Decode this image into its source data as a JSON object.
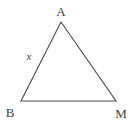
{
  "figure": {
    "type": "geometry-diagram",
    "shape": "triangle",
    "background_color": "#ffffff",
    "stroke_color": "#4a4a4a",
    "stroke_width": 1.1,
    "text_color": "#3f3f3f",
    "canvas": {
      "width": 136,
      "height": 123
    },
    "vertices": [
      {
        "name": "A",
        "label": "A",
        "x": 61,
        "y": 22,
        "label_x": 61,
        "label_y": 11
      },
      {
        "name": "B",
        "label": "B",
        "x": 21,
        "y": 101,
        "label_x": 10,
        "label_y": 112
      },
      {
        "name": "M",
        "label": "M",
        "x": 116,
        "y": 101,
        "label_x": 121,
        "label_y": 113
      }
    ],
    "sides": [
      {
        "name": "AB",
        "from": "A",
        "to": "B",
        "label": "x",
        "label_x": 29,
        "label_y": 56
      },
      {
        "name": "BM",
        "from": "B",
        "to": "M",
        "label": ""
      },
      {
        "name": "AM",
        "from": "A",
        "to": "M",
        "label": ""
      }
    ],
    "path_points": "61,22 21,101 116,101"
  }
}
